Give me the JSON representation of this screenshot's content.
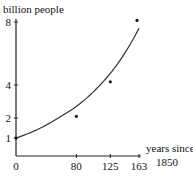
{
  "chart_data": {
    "type": "scatter",
    "title": "",
    "ylabel": "billion people",
    "xlabel_lines": [
      "years since",
      "1850"
    ],
    "x_ticks": [
      0,
      80,
      125,
      163
    ],
    "y_ticks": [
      1,
      2,
      4,
      8
    ],
    "xlim": [
      0,
      163
    ],
    "ylim": [
      0,
      8
    ],
    "grid": false,
    "legend": "none",
    "series": [
      {
        "name": "observed",
        "kind": "points",
        "x": [
          0,
          80,
          125,
          163
        ],
        "y": [
          1,
          2.1,
          4.2,
          8.1
        ]
      },
      {
        "name": "exponential fit",
        "kind": "curve",
        "model": "y = exp(k*x)",
        "k": 0.01245,
        "x_range": [
          0,
          163
        ]
      }
    ]
  }
}
